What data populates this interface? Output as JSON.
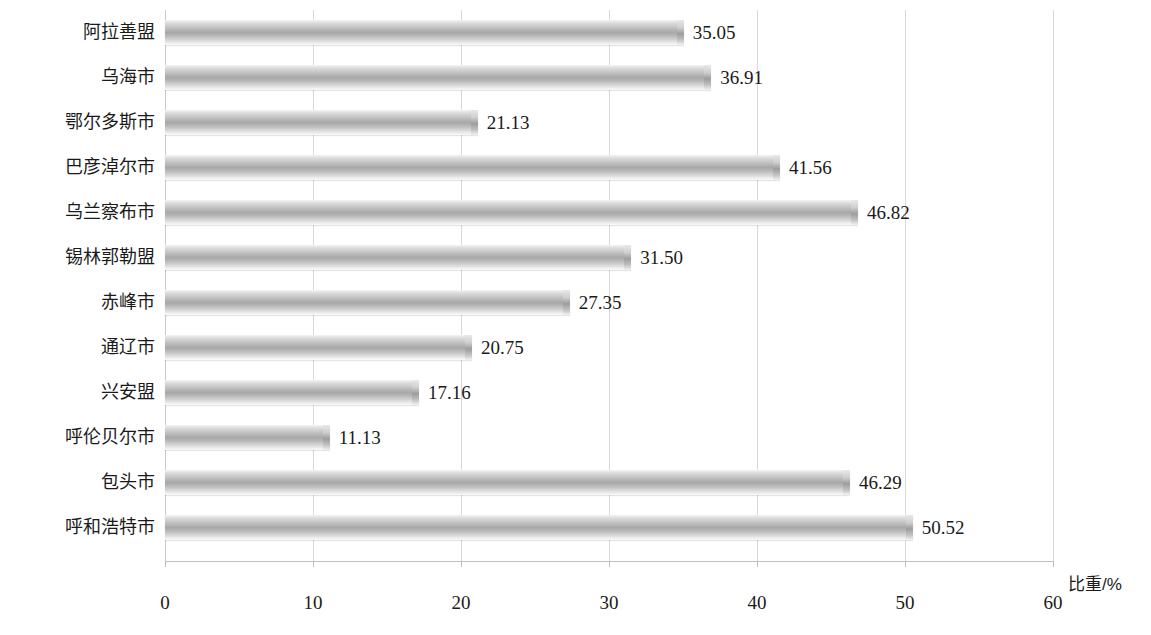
{
  "chart_data": {
    "type": "bar",
    "orientation": "horizontal",
    "title": "",
    "xlabel": "比重/%",
    "ylabel": "",
    "xlim": [
      0,
      60
    ],
    "xticks": [
      0,
      10,
      20,
      30,
      40,
      50,
      60
    ],
    "grid": true,
    "legend": false,
    "categories": [
      "阿拉善盟",
      "乌海市",
      "鄂尔多斯市",
      "巴彦淖尔市",
      "乌兰察布市",
      "锡林郭勒盟",
      "赤峰市",
      "通辽市",
      "兴安盟",
      "呼伦贝尔市",
      "包头市",
      "呼和浩特市"
    ],
    "values": [
      35.05,
      36.91,
      21.13,
      41.56,
      46.82,
      31.5,
      27.35,
      20.75,
      17.16,
      11.13,
      46.29,
      50.52
    ],
    "value_labels": [
      "35.05",
      "36.91",
      "21.13",
      "41.56",
      "46.82",
      "31.50",
      "27.35",
      "20.75",
      "17.16",
      "11.13",
      "46.29",
      "50.52"
    ],
    "bar_color": "#a8a8a8",
    "grid_color": "#d9d9d9",
    "axis_color": "#bfbfbf",
    "text_color": "#1a1a1a"
  },
  "axis": {
    "tick_labels": [
      "0",
      "10",
      "20",
      "30",
      "40",
      "50",
      "60"
    ],
    "title": "比重/%"
  }
}
